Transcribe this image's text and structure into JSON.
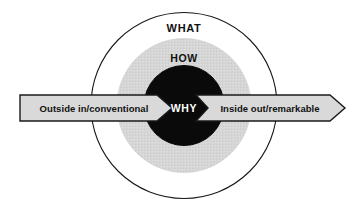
{
  "diagram": {
    "title_alt": "Golden Circle diagram",
    "background_color": "#ffffff",
    "rings": {
      "outer": {
        "label": "WHAT",
        "fill": "#ffffff",
        "stroke": "#1a1a1a",
        "radius": 93
      },
      "middle": {
        "label": "HOW",
        "fill": "#d6d6d6",
        "stroke": "#d6d6d6",
        "radius": 67
      },
      "inner": {
        "label": "WHY",
        "fill": "#0a0a0a",
        "stroke": "#0a0a0a",
        "text_color": "#ffffff",
        "radius": 40
      }
    },
    "arrows": {
      "left": {
        "label": "Outside in/conventional",
        "fill": "#d9d9d9",
        "stroke": "#1a1a1a",
        "direction": "right"
      },
      "right": {
        "label": "Inside out/remarkable",
        "fill": "#d9d9d9",
        "stroke": "#1a1a1a",
        "direction": "right"
      }
    }
  }
}
